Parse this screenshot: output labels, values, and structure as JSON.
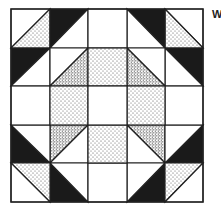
{
  "figure": {
    "type": "quilt-block-diagram",
    "grid": "5x5",
    "colors": {
      "background": "#ffffff",
      "outline": "#222222",
      "dark": "#1a1a1a",
      "stipple_light": "#555555",
      "stipple_dense": "#333333"
    },
    "edge_label": "W"
  }
}
